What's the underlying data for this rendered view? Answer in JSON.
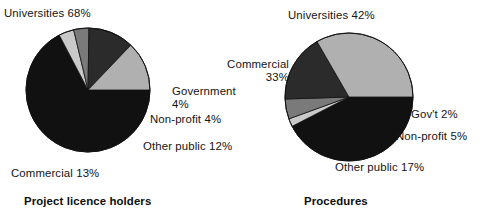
{
  "figure": {
    "background": "#ffffff",
    "palette": {
      "universities": "#111111",
      "commercial": "#b0b0b0",
      "other_public": "#2b2b2b",
      "non_profit": "#7a7a7a",
      "government": "#c9c9c9",
      "outline": "#111111",
      "text": "#141414"
    }
  },
  "charts": [
    {
      "id": "project-licence-holders",
      "title": "Project licence holders",
      "labels": {
        "universities": "Universities 68%",
        "government": "Government\n4%",
        "non_profit": "Non-profit 4%",
        "other_public": "Other public 12%",
        "commercial": "Commercial 13%"
      }
    },
    {
      "id": "procedures",
      "title": "Procedures",
      "labels": {
        "universities": "Universities 42%",
        "commercial": "Commercial\n33%",
        "government": "Gov't 2%",
        "non_profit": "Non-profit 5%",
        "other_public": "Other public 17%"
      }
    }
  ],
  "chart_data": [
    {
      "type": "pie",
      "title": "Project licence holders",
      "categories": [
        "Universities",
        "Government",
        "Non-profit",
        "Other public",
        "Commercial"
      ],
      "values": [
        68,
        4,
        4,
        12,
        13
      ],
      "unit": "percent",
      "colors": [
        "#111111",
        "#c9c9c9",
        "#7a7a7a",
        "#2b2b2b",
        "#b0b0b0"
      ],
      "start_angle_deg": 0,
      "direction": "clockwise",
      "legend": "labels-outside",
      "grid": false,
      "xlabel": "",
      "ylabel": ""
    },
    {
      "type": "pie",
      "title": "Procedures",
      "categories": [
        "Universities",
        "Gov't",
        "Non-profit",
        "Other public",
        "Commercial"
      ],
      "values": [
        42,
        2,
        5,
        17,
        33
      ],
      "unit": "percent",
      "colors": [
        "#111111",
        "#c9c9c9",
        "#7a7a7a",
        "#2b2b2b",
        "#b0b0b0"
      ],
      "start_angle_deg": 0,
      "direction": "clockwise",
      "legend": "labels-outside",
      "grid": false,
      "xlabel": "",
      "ylabel": ""
    }
  ],
  "geometry": [
    {
      "cx": 88,
      "cy": 90,
      "r": 62
    },
    {
      "cx": 349,
      "cy": 97,
      "r": 64
    }
  ]
}
